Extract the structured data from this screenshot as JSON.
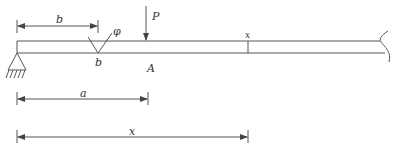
{
  "diagram": {
    "type": "beam-with-notch",
    "beam": {
      "left_support": "pin-support",
      "right_end": "break-line"
    },
    "labels": {
      "dim_b": "b",
      "notch_angle": "φ",
      "notch_label": "b",
      "load": "P",
      "point_A": "A",
      "section_x": "x",
      "dim_a": "a",
      "dim_x": "x"
    },
    "dimensions": [
      {
        "name": "b",
        "from": "support",
        "to": "notch"
      },
      {
        "name": "a",
        "from": "support",
        "to": "load P"
      },
      {
        "name": "x",
        "from": "support",
        "to": "section x"
      }
    ],
    "colors": {
      "line": "#555555",
      "text": "#333333",
      "background": "#ffffff"
    }
  }
}
